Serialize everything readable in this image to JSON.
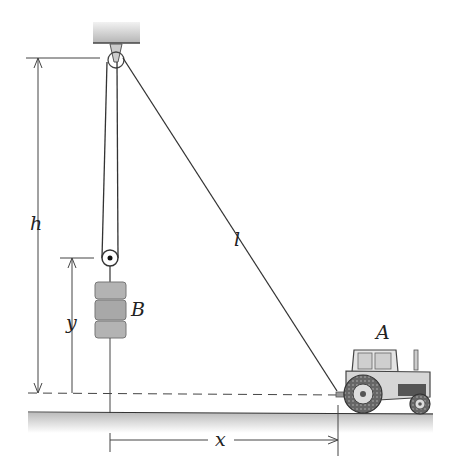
{
  "labels": {
    "h": "h",
    "y": "y",
    "B": "B",
    "l": "l",
    "A": "A",
    "x": "x"
  },
  "colors": {
    "line": "#333333",
    "ceiling_top": "#e8e8e8",
    "ceiling_bottom": "#b8b8b8",
    "ground_shade": "#c8c8c8",
    "block": "#b0b0b0",
    "tractor_body": "#d8d8d8",
    "tire": "#555555"
  }
}
